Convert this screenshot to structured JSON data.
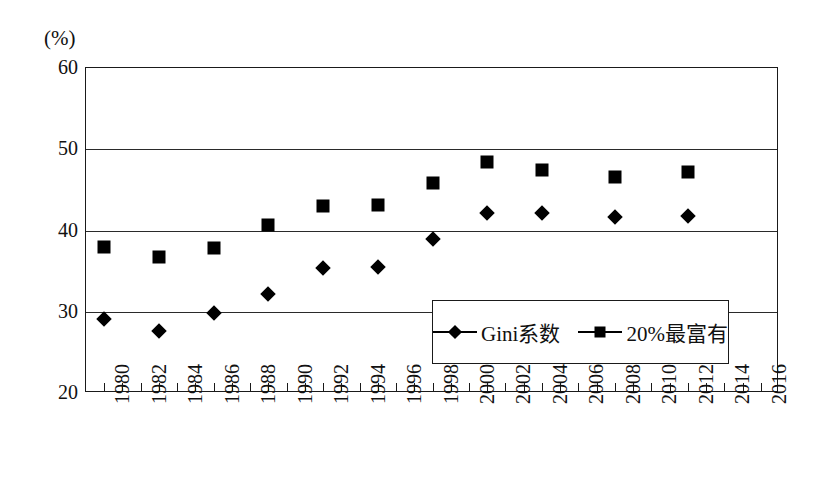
{
  "chart_data": {
    "type": "scatter",
    "title": "",
    "subtitle": "",
    "unit_label": "(%)",
    "xlabel": "",
    "ylabel": "",
    "xlim": [
      1979,
      2017
    ],
    "ylim": [
      20,
      60
    ],
    "yticks": [
      60,
      50,
      40,
      30,
      20
    ],
    "xticks": [
      1980,
      1982,
      1984,
      1986,
      1988,
      1990,
      1992,
      1994,
      1996,
      1998,
      2000,
      2002,
      2004,
      2006,
      2008,
      2010,
      2012,
      2014,
      2016
    ],
    "xtick_labels": [
      "1980",
      "1982",
      "1984",
      "1986",
      "1988",
      "1990",
      "1992",
      "1994",
      "1996",
      "1998",
      "2000",
      "2002",
      "2004",
      "2006",
      "2008",
      "2010",
      "2012",
      "2014",
      "2016"
    ],
    "grid": true,
    "grid_axis": "y",
    "legend_position": "lower-right-inside",
    "marker_color": "#000000",
    "series": [
      {
        "name": "Gini系数",
        "marker": "diamond",
        "x": [
          1980,
          1983,
          1986,
          1989,
          1992,
          1995,
          1998,
          2001,
          2004,
          2008,
          2012
        ],
        "values": [
          29.1,
          27.6,
          29.9,
          32.2,
          35.4,
          35.5,
          38.9,
          42.2,
          42.1,
          41.7,
          41.8
        ]
      },
      {
        "name": "20%最富有",
        "marker": "square",
        "x": [
          1980,
          1983,
          1986,
          1989,
          1992,
          1995,
          1998,
          2001,
          2004,
          2008,
          2012
        ],
        "values": [
          38.0,
          36.7,
          37.9,
          40.7,
          43.0,
          43.1,
          45.8,
          48.4,
          47.4,
          46.6,
          47.2
        ]
      }
    ],
    "legend": [
      {
        "label": "Gini系数",
        "marker": "diamond"
      },
      {
        "label": "20%最富有",
        "marker": "square"
      }
    ]
  }
}
